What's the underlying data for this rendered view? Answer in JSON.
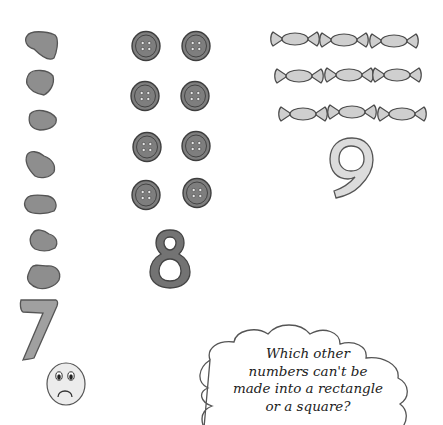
{
  "colors": {
    "background": "#ffffff",
    "stone_fill": "#8e8e8e",
    "stone_stroke": "#555555",
    "button_fill": "#7e7e7e",
    "button_stroke": "#3e3e3e",
    "candy_fill": "#cfcfcf",
    "candy_stroke": "#4a4a4a",
    "numeral_seven_fill": "#a0a0a0",
    "numeral_eight_fill": "#737373",
    "numeral_nine_fill": "#dcdcdc",
    "outline": "#444444",
    "text": "#222222"
  },
  "groups": [
    {
      "name": "stones",
      "count": 7,
      "numeral": "7",
      "arrangement": "single column (cannot form rectangle)"
    },
    {
      "name": "buttons",
      "count": 8,
      "numeral": "8",
      "arrangement": "2 columns x 4 rows"
    },
    {
      "name": "sweets",
      "count": 9,
      "numeral": "9",
      "arrangement": "3 x 3 square"
    }
  ],
  "numerals": {
    "seven": "7",
    "eight": "8",
    "nine": "9"
  },
  "sad_face": {
    "label": "sad face"
  },
  "thought_cloud": {
    "lines": [
      "Which other",
      "numbers can't be",
      "made into a rectangle",
      "or a square?"
    ]
  }
}
